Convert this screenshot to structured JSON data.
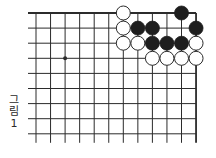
{
  "figure": {
    "caption_chars": [
      "그",
      "림",
      "1"
    ],
    "caption": "그림 1"
  },
  "board": {
    "cols": 12,
    "rows": 9,
    "origin_x": 36,
    "origin_y": 13,
    "spacing_x": 14.55,
    "spacing_y": 15.1,
    "edges": {
      "top": true,
      "right": true,
      "left": false,
      "bottom": false
    },
    "left_overhang": 8,
    "bottom_overhang": 9,
    "line_color": "#2b2b2b",
    "star_points": [
      {
        "col": 2,
        "row": 3
      }
    ],
    "stone_radius": 7,
    "black_color": "#1e1e1e",
    "white_fill": "#ffffff",
    "white_stroke": "#2b2b2b",
    "stones": [
      {
        "col": 6,
        "row": 0,
        "color": "white"
      },
      {
        "col": 10,
        "row": 0,
        "color": "black"
      },
      {
        "col": 6,
        "row": 1,
        "color": "white"
      },
      {
        "col": 7,
        "row": 1,
        "color": "black"
      },
      {
        "col": 8,
        "row": 1,
        "color": "black"
      },
      {
        "col": 11,
        "row": 1,
        "color": "black"
      },
      {
        "col": 6,
        "row": 2,
        "color": "white"
      },
      {
        "col": 7,
        "row": 2,
        "color": "white"
      },
      {
        "col": 8,
        "row": 2,
        "color": "black"
      },
      {
        "col": 9,
        "row": 2,
        "color": "black"
      },
      {
        "col": 10,
        "row": 2,
        "color": "black"
      },
      {
        "col": 11,
        "row": 2,
        "color": "white"
      },
      {
        "col": 8,
        "row": 3,
        "color": "white"
      },
      {
        "col": 9,
        "row": 3,
        "color": "white"
      },
      {
        "col": 10,
        "row": 3,
        "color": "white"
      },
      {
        "col": 11,
        "row": 3,
        "color": "white"
      }
    ]
  }
}
